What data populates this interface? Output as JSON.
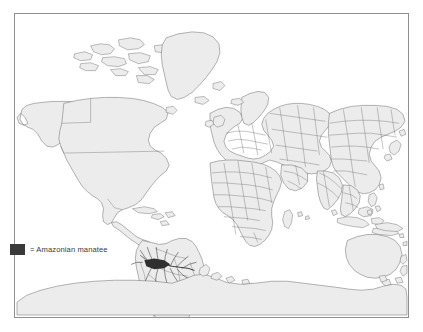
{
  "figure": {
    "type": "species-distribution-map",
    "projection": "world-mercator-like",
    "frame": {
      "border_color": "#8e9094",
      "background": "#ffffff"
    }
  },
  "map": {
    "land_fill": "#ececec",
    "land_stroke": "#58585a",
    "border_stroke": "#6a6a6c",
    "range_color": "#2f2f2f",
    "continents": [
      "North America",
      "South America",
      "Europe",
      "Africa",
      "Asia",
      "Australia",
      "Antarctica",
      "Greenland"
    ]
  },
  "legend": {
    "items": [
      {
        "swatch_color": "#3a3a3a",
        "equals_sign": "=",
        "label": "Amazonian manatee",
        "text": "= Amazonian manatee"
      }
    ]
  },
  "range": {
    "species": "Amazonian manatee",
    "region": "Amazon River basin, South America",
    "description": "Dark shading along the Amazon River and its tributaries in northern South America"
  }
}
